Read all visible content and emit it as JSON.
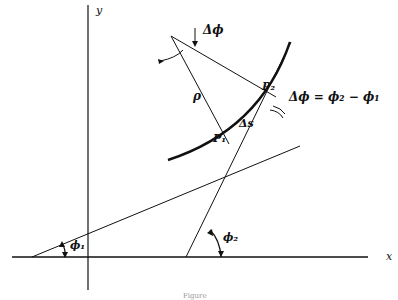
{
  "diagram": {
    "axes": {
      "x_label": "x",
      "y_label": "y"
    },
    "labels": {
      "delta_phi_top": "Δϕ",
      "rho": "ρ",
      "p1": "P₁",
      "p2": "P₂",
      "delta_s": "Δs",
      "delta_phi_eq": "Δϕ = ϕ₂ − ϕ₁",
      "phi1": "ϕ₁",
      "phi2": "ϕ₂"
    },
    "caption": "Figure"
  }
}
